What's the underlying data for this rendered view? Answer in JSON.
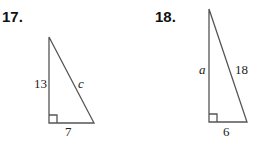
{
  "problems": [
    {
      "number": "17.",
      "legs": {
        "vertical": "13",
        "horizontal": "7"
      },
      "hypotenuse": "c",
      "right_angle": "bottom-left"
    },
    {
      "number": "18.",
      "legs": {
        "vertical": "a",
        "horizontal": "6"
      },
      "hypotenuse": "18",
      "right_angle": "bottom-left"
    }
  ],
  "colors": {
    "line": "#555555",
    "text": "#222222"
  }
}
